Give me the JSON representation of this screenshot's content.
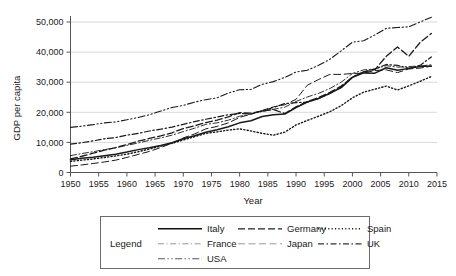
{
  "chart_data": {
    "type": "line",
    "title": "",
    "xlabel": "Year",
    "ylabel": "GDP per capita",
    "xlim": [
      1950,
      2015
    ],
    "ylim": [
      0,
      52000
    ],
    "grid": true,
    "legend_position": "bottom",
    "legend_title": "Legend",
    "y_ticks": [
      0,
      10000,
      20000,
      30000,
      40000,
      50000
    ],
    "y_tick_labels": [
      "0",
      "10,000",
      "20,000",
      "30,000",
      "40,000",
      "50,000"
    ],
    "x_ticks": [
      1950,
      1955,
      1960,
      1965,
      1970,
      1975,
      1980,
      1985,
      1990,
      1995,
      2000,
      2005,
      2010,
      2015
    ],
    "x_tick_labels": [
      "1950",
      "1955",
      "1960",
      "1965",
      "1970",
      "1975",
      "1980",
      "1985",
      "1990",
      "1995",
      "2000",
      "2005",
      "2010",
      "2015"
    ],
    "x": [
      1950,
      1952,
      1954,
      1956,
      1958,
      1960,
      1962,
      1964,
      1966,
      1968,
      1970,
      1972,
      1974,
      1976,
      1978,
      1980,
      1982,
      1984,
      1986,
      1988,
      1990,
      1992,
      1994,
      1996,
      1998,
      2000,
      2002,
      2004,
      2006,
      2008,
      2010,
      2012,
      2014
    ],
    "series": [
      {
        "name": "Italy",
        "style": "solid",
        "values": [
          4200,
          4700,
          5100,
          5600,
          6100,
          6800,
          7600,
          8200,
          9000,
          9900,
          11200,
          12200,
          13400,
          14200,
          15200,
          16500,
          17200,
          18600,
          19200,
          19400,
          21600,
          23400,
          24600,
          26300,
          28200,
          31600,
          33100,
          33000,
          34800,
          34000,
          34600,
          35200,
          35400
        ],
        "legend_label": "Italy"
      },
      {
        "name": "Germany",
        "style": "dashed",
        "values": [
          4500,
          5400,
          6400,
          7400,
          8300,
          9300,
          10400,
          11300,
          12200,
          13200,
          14600,
          15500,
          16600,
          17400,
          18500,
          19900,
          19700,
          20400,
          20900,
          19600,
          21800,
          23600,
          24900,
          26600,
          28700,
          31700,
          33400,
          34200,
          38600,
          41700,
          38600,
          43200,
          46200
        ],
        "legend_label": "Germany"
      },
      {
        "name": "Spain",
        "style": "dotted",
        "values": [
          3700,
          4100,
          4500,
          5000,
          5500,
          6100,
          6900,
          7800,
          8800,
          9700,
          10800,
          11900,
          13000,
          13500,
          14100,
          14500,
          13800,
          13000,
          12400,
          13400,
          15800,
          17300,
          18700,
          20200,
          22200,
          24800,
          26700,
          27700,
          28700,
          27400,
          28800,
          30300,
          31900
        ],
        "legend_label": "Spain"
      },
      {
        "name": "France",
        "style": "dash-dot-thin",
        "values": [
          5600,
          6300,
          6900,
          7600,
          8200,
          9000,
          9800,
          10700,
          11500,
          12400,
          13600,
          14700,
          16000,
          16500,
          17400,
          18700,
          19400,
          20300,
          21000,
          21700,
          23600,
          25100,
          26300,
          27900,
          30000,
          32900,
          34100,
          34400,
          35500,
          35000,
          35200,
          35400,
          35800
        ],
        "legend_label": "France"
      },
      {
        "name": "Japan",
        "style": "dashed-light",
        "values": [
          2100,
          2500,
          3000,
          3500,
          4100,
          5000,
          6000,
          7000,
          8300,
          9700,
          11500,
          12800,
          14500,
          15300,
          16500,
          18300,
          19400,
          20600,
          21800,
          22500,
          24300,
          29000,
          30900,
          32600,
          32600,
          32900,
          33000,
          33900,
          34100,
          33200,
          34400,
          34700,
          35300
        ],
        "legend_label": "Japan"
      },
      {
        "name": "UK",
        "style": "dash-dot",
        "values": [
          9400,
          9900,
          10500,
          11200,
          11600,
          12400,
          13000,
          13800,
          14400,
          15100,
          16000,
          16900,
          17700,
          18400,
          19200,
          19600,
          19500,
          20500,
          21600,
          22900,
          23200,
          23400,
          24600,
          26300,
          28300,
          31700,
          33500,
          34400,
          35900,
          35600,
          34600,
          35600,
          38400
        ],
        "legend_label": "UK"
      },
      {
        "name": "USA",
        "style": "dash-dot-dot",
        "values": [
          15000,
          15400,
          15900,
          16500,
          16800,
          17500,
          18300,
          19200,
          20400,
          21600,
          22300,
          23400,
          24200,
          24800,
          26400,
          27500,
          27600,
          29300,
          30200,
          31600,
          33400,
          34000,
          35600,
          37600,
          40400,
          43300,
          43800,
          45700,
          47900,
          48200,
          48400,
          50000,
          51600
        ],
        "legend_label": "USA"
      }
    ]
  },
  "legend": {
    "title": "Legend",
    "rows": [
      [
        "Italy",
        "Germany",
        "Spain"
      ],
      [
        "France",
        "Japan",
        "UK"
      ],
      [
        "USA"
      ]
    ]
  }
}
